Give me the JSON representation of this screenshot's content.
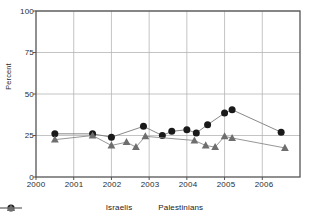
{
  "chart_data": {
    "type": "line",
    "title": "",
    "xlabel": "",
    "ylabel": "Percent",
    "ylim": [
      0,
      100
    ],
    "yticks": [
      0,
      25,
      50,
      75,
      100
    ],
    "ytick_labels": [
      "0",
      "25",
      "50",
      "75",
      "100"
    ],
    "xlim": [
      2000.0,
      2007.0
    ],
    "xticks": [
      2000,
      2001,
      2002,
      2003,
      2004,
      2005,
      2006
    ],
    "xtick_labels": [
      "2000",
      "2001",
      "2002",
      "2003",
      "2004",
      "2005",
      "2006"
    ],
    "grid": "both",
    "legend_position": "bottom",
    "series": [
      {
        "name": "Israelis",
        "marker": "circle",
        "color": "#1a1a1a",
        "line_color": "#7a7a7a",
        "x": [
          2000.5,
          2001.5,
          2002.0,
          2002.85,
          2003.35,
          2003.6,
          2004.0,
          2004.25,
          2004.55,
          2005.0,
          2005.2,
          2006.5
        ],
        "values": [
          26,
          26,
          24,
          30.5,
          25,
          27.5,
          28.5,
          26.5,
          31.5,
          38.5,
          40.5,
          27
        ]
      },
      {
        "name": "Palestinians",
        "marker": "triangle",
        "color": "#6e6e6e",
        "line_color": "#8a8a8a",
        "x": [
          2000.5,
          2001.5,
          2002.0,
          2002.4,
          2002.65,
          2002.9,
          2004.2,
          2004.5,
          2004.75,
          2005.0,
          2005.2,
          2006.6
        ],
        "values": [
          22.5,
          25,
          19,
          21,
          18,
          24.5,
          22,
          19,
          18,
          24.5,
          23.5,
          17.5
        ]
      }
    ]
  },
  "legend": {
    "israelis_label": "Israelis",
    "palestinians_label": "Palestinians"
  },
  "axes": {
    "ylabel": "Percent"
  },
  "colors": {
    "israelis_marker": "#1a1a1a",
    "palestinians_marker": "#6e6e6e",
    "grid": "#b5b5b5",
    "axis": "#555555",
    "text": "#2b2b2b"
  }
}
